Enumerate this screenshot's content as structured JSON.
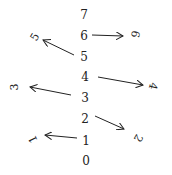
{
  "diagram": {
    "column": [
      {
        "label": "7",
        "x": 84,
        "y": 15
      },
      {
        "label": "6",
        "x": 84,
        "y": 36
      },
      {
        "label": "5",
        "x": 84,
        "y": 57
      },
      {
        "label": "4",
        "x": 85,
        "y": 77
      },
      {
        "label": "3",
        "x": 85,
        "y": 98
      },
      {
        "label": "2",
        "x": 85,
        "y": 119
      },
      {
        "label": "1",
        "x": 86,
        "y": 141
      },
      {
        "label": "0",
        "x": 86,
        "y": 161
      }
    ],
    "rotated": [
      {
        "label": "6",
        "x": 135,
        "y": 34,
        "angle": 100
      },
      {
        "label": "5",
        "x": 35,
        "y": 37,
        "angle": -60
      },
      {
        "label": "4",
        "x": 153,
        "y": 86,
        "angle": 105
      },
      {
        "label": "3",
        "x": 14,
        "y": 87,
        "angle": -90
      },
      {
        "label": "2",
        "x": 138,
        "y": 138,
        "angle": 120
      },
      {
        "label": "1",
        "x": 33,
        "y": 139,
        "angle": -115
      }
    ],
    "arrows": [
      {
        "from": "6",
        "x1": 92,
        "y1": 35,
        "x2": 123,
        "y2": 36
      },
      {
        "from": "5",
        "x1": 74,
        "y1": 55,
        "x2": 43,
        "y2": 40
      },
      {
        "from": "4",
        "x1": 98,
        "y1": 77,
        "x2": 143,
        "y2": 85
      },
      {
        "from": "3",
        "x1": 71,
        "y1": 95,
        "x2": 30,
        "y2": 87
      },
      {
        "from": "2",
        "x1": 95,
        "y1": 116,
        "x2": 124,
        "y2": 129
      },
      {
        "from": "1",
        "x1": 77,
        "y1": 138,
        "x2": 45,
        "y2": 135
      }
    ]
  }
}
